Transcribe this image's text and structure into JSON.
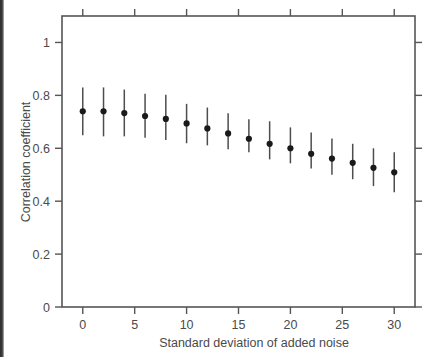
{
  "figure": {
    "background_color": "#ffffff",
    "axis_color": "#555555",
    "marker_color": "#1a1a1a",
    "errorbar_color": "#4d4d4d",
    "text_color": "#4a4a4a"
  },
  "chart_data": {
    "type": "scatter",
    "title": "",
    "subtitle": "",
    "xlabel": "Standard deviation of added noise",
    "ylabel": "Correlation coefficient",
    "xlim": [
      -2,
      32
    ],
    "ylim": [
      0,
      1.1
    ],
    "xticks": [
      0,
      5,
      10,
      15,
      20,
      25,
      30
    ],
    "xtick_labels": [
      "0",
      "5",
      "10",
      "15",
      "20",
      "25",
      "30"
    ],
    "yticks": [
      0,
      0.2,
      0.4,
      0.6,
      0.8,
      1
    ],
    "ytick_labels": [
      "0",
      "0.2",
      "0.4",
      "0.6",
      "0.8",
      "1"
    ],
    "grid": false,
    "legend": null,
    "legend_position": "none",
    "annotations": [],
    "x": [
      0,
      2,
      4,
      6,
      8,
      10,
      12,
      14,
      16,
      18,
      20,
      22,
      24,
      26,
      28,
      30
    ],
    "values": [
      0.74,
      0.74,
      0.733,
      0.722,
      0.711,
      0.694,
      0.675,
      0.656,
      0.636,
      0.617,
      0.6,
      0.579,
      0.561,
      0.545,
      0.526,
      0.509
    ],
    "err_low": [
      0.649,
      0.645,
      0.645,
      0.64,
      0.631,
      0.619,
      0.611,
      0.596,
      0.585,
      0.558,
      0.543,
      0.524,
      0.5,
      0.483,
      0.457,
      0.434
    ],
    "err_high": [
      0.83,
      0.83,
      0.822,
      0.806,
      0.802,
      0.768,
      0.754,
      0.732,
      0.71,
      0.702,
      0.679,
      0.66,
      0.637,
      0.617,
      0.6,
      0.585
    ]
  }
}
